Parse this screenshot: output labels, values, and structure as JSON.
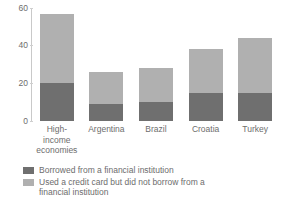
{
  "chart_data": {
    "type": "bar",
    "subtype": "stacked-bar",
    "title": "",
    "subtitle": "",
    "xlabel": "",
    "ylabel": "",
    "ylim": [
      0,
      60
    ],
    "yticks": [
      "0",
      "20",
      "40",
      "60"
    ],
    "ytick_values": [
      0,
      20,
      40,
      60
    ],
    "grid": false,
    "legend_position": "bottom-left",
    "categories": [
      "High-income economies",
      "Argentina",
      "Brazil",
      "Croatia",
      "Turkey"
    ],
    "category_labels_wrapped": [
      [
        "High-",
        "income",
        "economies"
      ],
      [
        "Argentina"
      ],
      [
        "Brazil"
      ],
      [
        "Croatia"
      ],
      [
        "Turkey"
      ]
    ],
    "series": [
      {
        "name": "Borrowed from a financial institution",
        "color": "#6f6f6f",
        "values": [
          20,
          9,
          10,
          15,
          15
        ]
      },
      {
        "name": "Used a credit card but did not borrow from a financial institution",
        "color": "#b0b0b0",
        "values": [
          37,
          17,
          18,
          23,
          29
        ]
      }
    ],
    "totals": [
      57,
      26,
      28,
      38,
      44
    ]
  },
  "legend": {
    "items": [
      {
        "swatch": "dark",
        "label": "Borrowed from a financial institution"
      },
      {
        "swatch": "light",
        "label": "Used a credit card but did not borrow from a financial institution"
      }
    ]
  },
  "colors": {
    "series_dark": "#6f6f6f",
    "series_light": "#b0b0b0",
    "axis": "#c9c9c9",
    "text": "#6d6d6d",
    "background": "#ffffff"
  }
}
